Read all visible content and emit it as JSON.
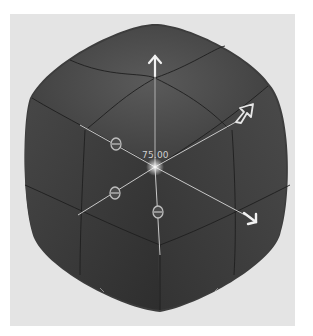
{
  "viewport": {
    "object": "rounded-cube",
    "background_color": "#e4e4e4",
    "mesh_color": "#3c3c3c"
  },
  "manipulator": {
    "value_label": "75.00",
    "handles": [
      {
        "name": "up-arrow",
        "direction": "y"
      },
      {
        "name": "right-up-arrow",
        "direction": "x"
      },
      {
        "name": "right-down-arrow",
        "direction": "z"
      }
    ],
    "scale_handles": 3
  }
}
